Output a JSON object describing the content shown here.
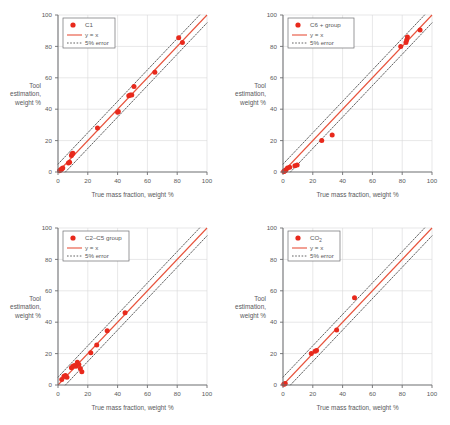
{
  "figure": {
    "axis": {
      "xlabel": "True mass fraction, weight %",
      "ylabel_lines": [
        "Tool",
        "estimation,",
        "weight %"
      ],
      "xticks": [
        "0",
        "20",
        "40",
        "60",
        "80",
        "100"
      ],
      "yticks": [
        "0",
        "20",
        "40",
        "60",
        "80",
        "100"
      ]
    },
    "legend": {
      "line_label": "y = x",
      "error_label": "5% error"
    },
    "colors": {
      "marker": "#e8291c",
      "identity_line": "#e8533c",
      "error_line": "#3b3b3b",
      "grid": "#d6d7d9",
      "axis": "#6d6e71",
      "text": "#58595b"
    }
  },
  "chart_data": [
    {
      "type": "scatter",
      "title": "C1",
      "xlabel": "True mass fraction, weight %",
      "ylabel": "Tool estimation, weight %",
      "xlim": [
        0,
        100
      ],
      "ylim": [
        0,
        100
      ],
      "xticks": [
        0,
        20,
        40,
        60,
        80,
        100
      ],
      "yticks": [
        0,
        20,
        40,
        60,
        80,
        100
      ],
      "grid": true,
      "legend_position": "top-left",
      "series": [
        {
          "name": "C1",
          "marker": "filled-circle",
          "points": [
            [
              1.0,
              0.8
            ],
            [
              1.5,
              1.2
            ],
            [
              2.0,
              1.5
            ],
            [
              2.6,
              2.0
            ],
            [
              3.2,
              2.6
            ],
            [
              7.0,
              5.8
            ],
            [
              7.8,
              6.2
            ],
            [
              9.0,
              10.5
            ],
            [
              9.5,
              11.5
            ],
            [
              10.0,
              12.0
            ],
            [
              26.5,
              28.0
            ],
            [
              40.0,
              38.0
            ],
            [
              40.5,
              38.5
            ],
            [
              47.5,
              48.5
            ],
            [
              48.5,
              49.0
            ],
            [
              49.5,
              49.0
            ],
            [
              51.0,
              54.5
            ],
            [
              65.0,
              63.5
            ],
            [
              81.0,
              85.5
            ],
            [
              83.5,
              82.5
            ]
          ]
        },
        {
          "name": "y = x",
          "type": "line",
          "points": [
            [
              0,
              0
            ],
            [
              100,
              100
            ]
          ]
        },
        {
          "name": "5% error upper",
          "type": "dashed-line",
          "points": [
            [
              0,
              5
            ],
            [
              95,
              100
            ]
          ]
        },
        {
          "name": "5% error lower",
          "type": "dashed-line",
          "points": [
            [
              5,
              0
            ],
            [
              100,
              95
            ]
          ]
        }
      ]
    },
    {
      "type": "scatter",
      "title": "C6 + group",
      "xlabel": "True mass fraction, weight %",
      "ylabel": "Tool estimation, weight %",
      "xlim": [
        0,
        100
      ],
      "ylim": [
        0,
        100
      ],
      "xticks": [
        0,
        20,
        40,
        60,
        80,
        100
      ],
      "yticks": [
        0,
        20,
        40,
        60,
        80,
        100
      ],
      "grid": true,
      "legend_position": "top-left",
      "series": [
        {
          "name": "C6 + group",
          "marker": "filled-circle",
          "points": [
            [
              0.5,
              0.3
            ],
            [
              0.8,
              0.5
            ],
            [
              1.2,
              0.8
            ],
            [
              1.6,
              1.0
            ],
            [
              2.0,
              1.4
            ],
            [
              3.0,
              2.5
            ],
            [
              4.5,
              3.0
            ],
            [
              8.0,
              4.0
            ],
            [
              9.5,
              4.5
            ],
            [
              26.0,
              20.0
            ],
            [
              33.0,
              23.5
            ],
            [
              79.0,
              80.0
            ],
            [
              82.5,
              82.5
            ],
            [
              83.0,
              84.0
            ],
            [
              83.5,
              86.0
            ],
            [
              92.0,
              90.5
            ]
          ]
        },
        {
          "name": "y = x",
          "type": "line",
          "points": [
            [
              0,
              0
            ],
            [
              100,
              100
            ]
          ]
        },
        {
          "name": "5% error upper",
          "type": "dashed-line",
          "points": [
            [
              0,
              5
            ],
            [
              95,
              100
            ]
          ]
        },
        {
          "name": "5% error lower",
          "type": "dashed-line",
          "points": [
            [
              5,
              0
            ],
            [
              100,
              95
            ]
          ]
        }
      ]
    },
    {
      "type": "scatter",
      "title": "C2–C5 group",
      "xlabel": "True mass fraction, weight %",
      "ylabel": "Tool estimation, weight %",
      "xlim": [
        0,
        100
      ],
      "ylim": [
        0,
        100
      ],
      "xticks": [
        0,
        20,
        40,
        60,
        80,
        100
      ],
      "yticks": [
        0,
        20,
        40,
        60,
        80,
        100
      ],
      "grid": true,
      "legend_position": "top-left",
      "series": [
        {
          "name": "C2–C5 group",
          "marker": "filled-circle",
          "points": [
            [
              2.5,
              3.5
            ],
            [
              4.0,
              5.5
            ],
            [
              5.0,
              6.0
            ],
            [
              6.0,
              5.0
            ],
            [
              9.0,
              11.0
            ],
            [
              10.0,
              12.0
            ],
            [
              11.0,
              12.5
            ],
            [
              12.0,
              12.0
            ],
            [
              13.0,
              14.5
            ],
            [
              14.0,
              13.0
            ],
            [
              15.0,
              10.5
            ],
            [
              16.0,
              8.5
            ],
            [
              22.0,
              20.5
            ],
            [
              26.0,
              25.5
            ],
            [
              33.0,
              34.5
            ],
            [
              45.0,
              46.0
            ]
          ]
        },
        {
          "name": "y = x",
          "type": "line",
          "points": [
            [
              0,
              0
            ],
            [
              100,
              100
            ]
          ]
        },
        {
          "name": "5% error upper",
          "type": "dashed-line",
          "points": [
            [
              0,
              5
            ],
            [
              95,
              100
            ]
          ]
        },
        {
          "name": "5% error lower",
          "type": "dashed-line",
          "points": [
            [
              5,
              0
            ],
            [
              100,
              95
            ]
          ]
        }
      ]
    },
    {
      "type": "scatter",
      "title": "CO2",
      "title_base": "CO",
      "title_sub": "2",
      "xlabel": "True mass fraction, weight %",
      "ylabel": "Tool estimation, weight %",
      "xlim": [
        0,
        100
      ],
      "ylim": [
        0,
        100
      ],
      "xticks": [
        0,
        20,
        40,
        60,
        80,
        100
      ],
      "yticks": [
        0,
        20,
        40,
        60,
        80,
        100
      ],
      "grid": true,
      "legend_position": "top-left",
      "series": [
        {
          "name": "CO2",
          "marker": "filled-circle",
          "points": [
            [
              0.5,
              0.4
            ],
            [
              1.0,
              0.6
            ],
            [
              1.5,
              1.0
            ],
            [
              19.0,
              20.0
            ],
            [
              21.5,
              21.5
            ],
            [
              22.5,
              22.0
            ],
            [
              36.0,
              35.0
            ],
            [
              48.0,
              55.5
            ]
          ]
        },
        {
          "name": "y = x",
          "type": "line",
          "points": [
            [
              0,
              0
            ],
            [
              100,
              100
            ]
          ]
        },
        {
          "name": "5% error upper",
          "type": "dashed-line",
          "points": [
            [
              0,
              5
            ],
            [
              95,
              100
            ]
          ]
        },
        {
          "name": "5% error lower",
          "type": "dashed-line",
          "points": [
            [
              5,
              0
            ],
            [
              100,
              95
            ]
          ]
        }
      ]
    }
  ]
}
